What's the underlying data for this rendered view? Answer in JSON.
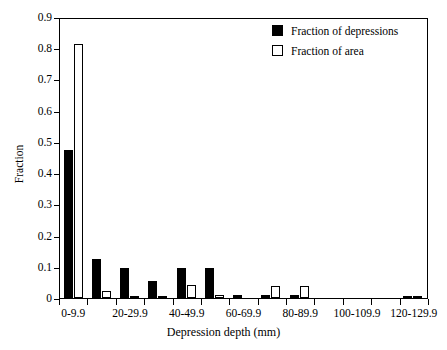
{
  "chart_data": {
    "type": "bar",
    "title": "",
    "xlabel": "Depression depth (mm)",
    "ylabel": "Fraction",
    "ylim": [
      0,
      0.9
    ],
    "ytick_labels": [
      "0.9",
      "0.8",
      "0.7",
      "0.6",
      "0.5",
      "0.4",
      "0.3",
      "0.2",
      "0.1",
      "0"
    ],
    "ytick_values": [
      0.9,
      0.8,
      0.7,
      0.6,
      0.5,
      0.4,
      0.3,
      0.2,
      0.1,
      0.0
    ],
    "grid": false,
    "legend_position": "top-right",
    "categories": [
      "0-9.9",
      "10-19.9",
      "20-29.9",
      "30-39.9",
      "40-49.9",
      "50-59.9",
      "60-69.9",
      "70-79.9",
      "80-89.9",
      "90-99.9",
      "100-109.9",
      "110-119.9",
      "120-129.9"
    ],
    "xtick_labels_shown": [
      "0-9.9",
      "20-29.9",
      "40-49.9",
      "60-69.9",
      "80-89.9",
      "100-109.9",
      "120-129.9"
    ],
    "series": [
      {
        "name": "Fraction of depressions",
        "color": "#000000",
        "fill": "solid",
        "values": [
          0.475,
          0.124,
          0.097,
          0.055,
          0.096,
          0.095,
          0.011,
          0.01,
          0.01,
          0.0,
          0.0,
          0.0,
          0.006
        ]
      },
      {
        "name": "Fraction of area",
        "color": "#ffffff",
        "fill": "open",
        "values": [
          0.815,
          0.021,
          0.002,
          0.005,
          0.041,
          0.009,
          0.0,
          0.038,
          0.038,
          0.0,
          0.0,
          0.0,
          0.003
        ]
      }
    ]
  },
  "legend": {
    "entries": [
      {
        "label": "Fraction of depressions",
        "swatch": "filled-black-square"
      },
      {
        "label": "Fraction of area",
        "swatch": "open-white-square"
      }
    ]
  },
  "axes": {
    "y_title": "Fraction",
    "x_title": "Depression depth (mm)"
  }
}
